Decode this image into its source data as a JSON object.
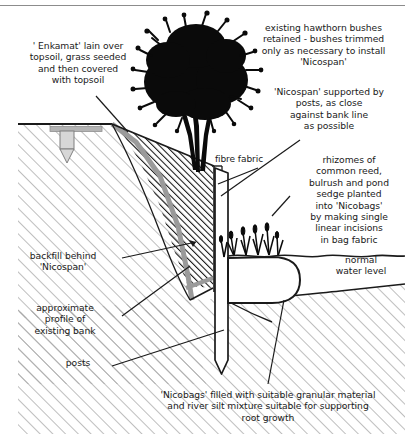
{
  "diagram": {
    "colors": {
      "ink": "#1a1a1a",
      "bank_hatch": "#a8a8a8",
      "backfill_hatch": "#111111",
      "geotextile_band": "#9a9a9a",
      "background": "#ffffff",
      "top_rule": "#8c8c8c"
    },
    "labels": {
      "enkamat": "' Enkamat' lain over\ntopsoil, grass seeded\nand then covered\nwith topsoil",
      "hawthorn": "existing hawthorn bushes\nretained - bushes trimmed\nonly as necessary to install\n'Nicospan'",
      "nicospan_posts": "'Nicospan' supported by\nposts, as close\nagainst bank line\nas possible",
      "fibre_fabric": "fibre fabric",
      "rhizomes": "rhizomes of\ncommon reed,\nbulrush and pond\nsedge planted\ninto 'Nicobags'\nby making single\nlinear incisions\nin bag fabric",
      "normal_water_level": "normal\nwater level",
      "backfill": "backfill behind\n'Nicospan'",
      "approximate_profile": "approximate\nprofile of\nexisting bank",
      "posts": "posts",
      "nicobags": "'Nicobags' filled with suitable granular material\nand river silt mixture suitable for supporting\nroot growth"
    },
    "elements": {
      "bush": "hawthorn-bush-silhouette",
      "post": "timber-post",
      "anchor_peg": "enkamat-anchor-peg",
      "nicobag": "nicobag-roll",
      "water_line": "normal-water-level-line",
      "reeds": "planted-reed-tufts",
      "riverbed": "river-bed-hatching",
      "bank": "existing-bank-hatching",
      "backfill_wedge": "backfill-hatching"
    }
  }
}
